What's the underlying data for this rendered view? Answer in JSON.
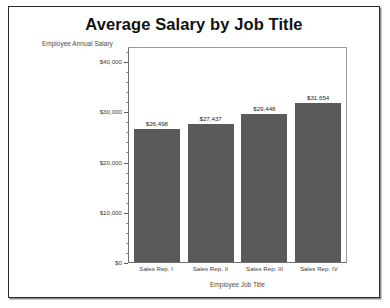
{
  "chart_data": {
    "type": "bar",
    "title": "Average Salary by Job Title",
    "xlabel": "Employee Job Title",
    "ylabel": "Employee Annual Salary",
    "categories": [
      "Sales Rep. I",
      "Sales Rep. II",
      "Sales Rep. III",
      "Sales Rep. IV"
    ],
    "values": [
      26498,
      27437,
      29448,
      31654
    ],
    "value_labels": [
      "$26,498",
      "$27,437",
      "$29,448",
      "$31,654"
    ],
    "ylim": [
      0,
      43000
    ],
    "ytick_values": [
      0,
      10000,
      20000,
      30000,
      40000
    ],
    "ytick_labels": [
      "$0",
      "$10,000",
      "$20,000",
      "$30,000",
      "$40,000"
    ],
    "yminor_interval": 2000,
    "grid": false,
    "legend": false,
    "bar_color": "#5a5a5a",
    "plot_border_color": "#6f6f6f",
    "text_color": "#3d3d3d"
  }
}
